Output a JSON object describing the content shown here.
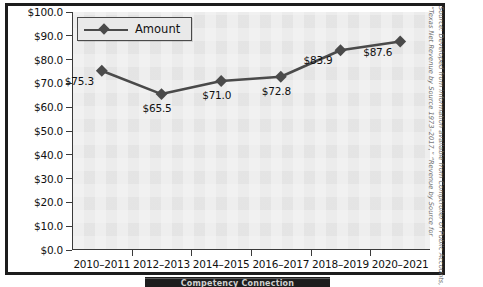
{
  "chart_data": {
    "type": "line",
    "title": "",
    "subtitle": "",
    "xlabel": "",
    "ylabel": "",
    "categories": [
      "2010–2011",
      "2012–2013",
      "2014–2015",
      "2016–2017",
      "2018–2019",
      "2020–2021"
    ],
    "series": [
      {
        "name": "Amount",
        "values": [
          75.3,
          65.5,
          71.0,
          72.8,
          83.9,
          87.6
        ],
        "point_labels": [
          "$75.3",
          "$65.5",
          "$71.0",
          "$72.8",
          "$83.9",
          "$87.6"
        ],
        "color": "#4a4a4a",
        "marker": "diamond"
      }
    ],
    "ylim": [
      0,
      100
    ],
    "ytick_step": 10,
    "ytick_labels": [
      "$100.0",
      "$90.0",
      "$80.0",
      "$70.0",
      "$60.0",
      "$50.0",
      "$40.0",
      "$30.0",
      "$20.0",
      "$10.0",
      "$0.0"
    ],
    "ytick_values": [
      100,
      90,
      80,
      70,
      60,
      50,
      40,
      30,
      20,
      10,
      0
    ],
    "grid": false,
    "legend_position": "top-left-inside",
    "plot_background": "#e9e9e9"
  },
  "legend": {
    "items": [
      {
        "label": "Amount"
      }
    ]
  },
  "source_note": {
    "text": "Source: Developed from information available from Comptroller of Public Accounts, “Texas Net Revenue by Source 1973–2017,” “Revenue by Source for"
  },
  "footer_band": {
    "text": "Competency Connection"
  }
}
